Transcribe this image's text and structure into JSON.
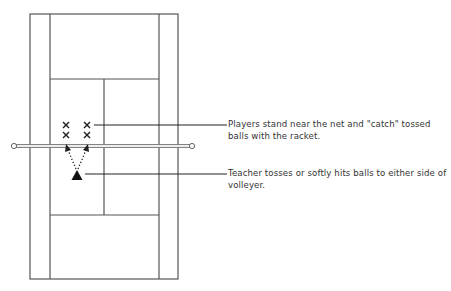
{
  "diagram": {
    "type": "tennis-court-drill",
    "court": {
      "line_color": "#555555",
      "outer": {
        "left": 30,
        "top": 14,
        "right": 178,
        "bottom": 279
      },
      "singles_sidelines": {
        "left": 50,
        "right": 159
      },
      "service_lines": {
        "top": 79,
        "bottom": 215
      },
      "center_service_x": 104
    },
    "net": {
      "y": 146,
      "left_post_x": 14,
      "right_post_x": 192,
      "color": "#888888"
    },
    "players": {
      "symbol": "X",
      "positions": [
        {
          "x": 66,
          "y": 125
        },
        {
          "x": 87,
          "y": 125
        },
        {
          "x": 66,
          "y": 135
        },
        {
          "x": 87,
          "y": 135
        }
      ]
    },
    "teacher": {
      "symbol": "triangle",
      "x": 77,
      "y": 175
    },
    "callouts": [
      {
        "id": "players",
        "text": "Players stand near the net and \"catch\" tossed balls with the racket."
      },
      {
        "id": "teacher",
        "text": "Teacher tosses or softly hits balls to either side of volleyer."
      }
    ]
  }
}
